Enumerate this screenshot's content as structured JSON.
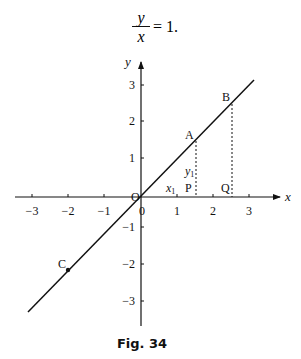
{
  "equation": {
    "numerator": "y",
    "denominator": "x",
    "rest": "= 1."
  },
  "caption": "Fig. 34",
  "axes": {
    "x_label": "x",
    "y_label": "y",
    "origin_label": "O",
    "x_ticks": [
      "−3",
      "−2",
      "−1",
      "0",
      "1",
      "2",
      "3"
    ],
    "y_ticks": [
      "3",
      "2",
      "1",
      "−1",
      "−2",
      "−3"
    ]
  },
  "points": {
    "A": {
      "label": "A",
      "x": 1.5,
      "y": 1.5
    },
    "B": {
      "label": "B",
      "x": 2.5,
      "y": 2.5
    },
    "C": {
      "label": "C",
      "x": -2,
      "y": -2
    },
    "P": {
      "label": "P",
      "x": 1.5,
      "y": 0
    },
    "Q": {
      "label": "Q",
      "x": 2.5,
      "y": 0
    }
  },
  "annotations": {
    "x1": "x",
    "x1_sub": "1",
    "y1": "y",
    "y1_sub": "1"
  },
  "line": {
    "equation": "y = x",
    "x_start": -3.1,
    "x_end": 3.1
  },
  "colors": {
    "ink": "#111111",
    "background": "#ffffff"
  }
}
